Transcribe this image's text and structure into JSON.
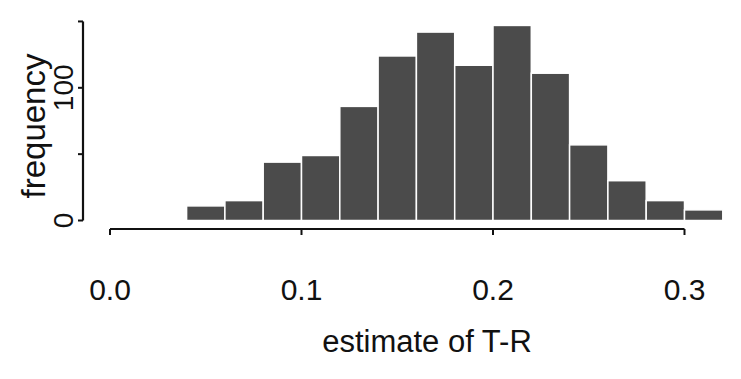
{
  "chart_data": {
    "type": "bar",
    "subtype": "histogram",
    "title": "",
    "xlabel": "estimate of T-R",
    "ylabel": "frequency",
    "bin_width": 0.02,
    "bin_edges": [
      0.0,
      0.02,
      0.04,
      0.06,
      0.08,
      0.1,
      0.12,
      0.14,
      0.16,
      0.18,
      0.2,
      0.22,
      0.24,
      0.26,
      0.28,
      0.3,
      0.32
    ],
    "categories": [
      "0.00-0.02",
      "0.02-0.04",
      "0.04-0.06",
      "0.06-0.08",
      "0.08-0.10",
      "0.10-0.12",
      "0.12-0.14",
      "0.14-0.16",
      "0.16-0.18",
      "0.18-0.20",
      "0.20-0.22",
      "0.22-0.24",
      "0.24-0.26",
      "0.26-0.28",
      "0.28-0.30",
      "0.30-0.32"
    ],
    "values": [
      1,
      1,
      11,
      15,
      44,
      49,
      86,
      124,
      142,
      117,
      147,
      111,
      57,
      30,
      15,
      8
    ],
    "xlim": [
      0.0,
      0.32
    ],
    "ylim": [
      0,
      150
    ],
    "x_ticks": [
      0.0,
      0.1,
      0.2,
      0.3
    ],
    "x_tick_labels": [
      "0.0",
      "0.1",
      "0.2",
      "0.3"
    ],
    "y_ticks": [
      0,
      50,
      100,
      150
    ],
    "y_tick_labels": [
      "0",
      "",
      "100",
      ""
    ],
    "grid": false,
    "legend": null,
    "bar_color": "#4b4b4b"
  }
}
